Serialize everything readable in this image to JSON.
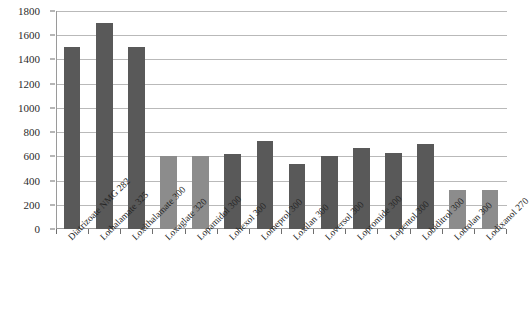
{
  "chart_data": {
    "type": "bar",
    "title": "",
    "subtitle": "",
    "xlabel": "",
    "ylabel": "",
    "ylim": [
      0,
      1800
    ],
    "ytick_step": 200,
    "yticks": [
      0,
      200,
      400,
      600,
      800,
      1000,
      1200,
      1400,
      1600,
      1800
    ],
    "ytick_labels": [
      "0",
      "200",
      "400",
      "600",
      "800",
      "1000",
      "1200",
      "1400",
      "1600",
      "1800"
    ],
    "grid": "horizontal",
    "legend": "none",
    "categories": [
      "Diatrizoate NMG 282",
      "Lothalamate 325",
      "Loxithalamate 300",
      "Loxaglate 320",
      "Lopamidol 300",
      "Lohexol 300",
      "Lomeprol 300",
      "Loxilan 300",
      "Loversol 300",
      "Lopromide 300",
      "Lopentol 300",
      "Lobiditrol 300",
      "Lotrolan 300",
      "Lodixanol 270"
    ],
    "values": [
      1500,
      1700,
      1500,
      600,
      600,
      620,
      730,
      540,
      600,
      665,
      630,
      700,
      320,
      320
    ],
    "bar_colors": [
      "#595959",
      "#595959",
      "#595959",
      "#8c8c8c",
      "#8c8c8c",
      "#595959",
      "#595959",
      "#595959",
      "#595959",
      "#595959",
      "#595959",
      "#595959",
      "#8c8c8c",
      "#8c8c8c"
    ],
    "colors": {
      "bar_dark": "#595959",
      "bar_light": "#8c8c8c",
      "gridline": "#b9b9b9",
      "axis": "#9a9a9a",
      "text": "#2b2b2b",
      "background": "#ffffff"
    }
  }
}
